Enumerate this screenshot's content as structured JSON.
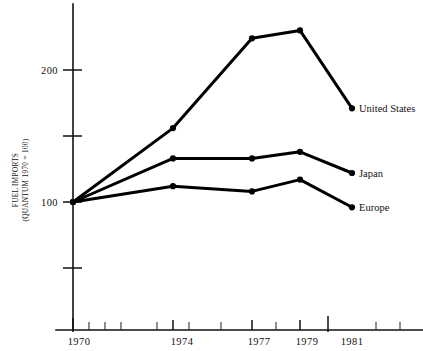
{
  "chart_data": {
    "type": "line",
    "title": "",
    "subtitle": "",
    "xlabel": "",
    "ylabel": "FUEL IMPORTS (QUANTUM 1970 = 100)",
    "ylabel_line1": "FUEL IMPORTS",
    "ylabel_line2": "(QUANTUM 1970 = 100)",
    "x": [
      1970,
      1974,
      1977,
      1979,
      1981
    ],
    "categories": [
      "1970",
      "1974",
      "1977",
      "1979",
      "1981"
    ],
    "xtick_labels": [
      "1970",
      "1974",
      "1977",
      "1979",
      "1981"
    ],
    "ytick_labels": [
      "200",
      "100"
    ],
    "ytick_values": [
      200,
      100
    ],
    "yticks_unlabeled": [
      150,
      50
    ],
    "xlim": [
      1969.4,
      1983.0
    ],
    "ylim": [
      10,
      255
    ],
    "grid": false,
    "legend_position": "right-inline-end-of-line",
    "series": [
      {
        "name": "United States",
        "label": "United States",
        "color": "#000000",
        "values": [
          100,
          156,
          224,
          230,
          171
        ]
      },
      {
        "name": "Japan",
        "label": "Japan",
        "color": "#000000",
        "values": [
          100,
          133,
          133,
          138,
          122
        ]
      },
      {
        "name": "Europe",
        "label": "Europe",
        "color": "#000000",
        "values": [
          100,
          112,
          108,
          117,
          96
        ]
      }
    ],
    "minor_xticks": [
      1971,
      1972,
      1973,
      1975,
      1976,
      1978,
      1980,
      1982
    ],
    "major_xticks": [
      1970,
      1974,
      1977,
      1979,
      1981
    ]
  },
  "colors": {
    "ink": "#000000",
    "axis": "#111111",
    "background": "#ffffff"
  }
}
